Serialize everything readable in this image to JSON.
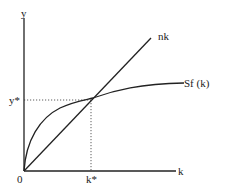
{
  "diagram": {
    "axes": {
      "y_label": "y",
      "x_label": "k",
      "origin_label": "0"
    },
    "curves": [
      {
        "name": "nk",
        "label": "nk",
        "type": "line"
      },
      {
        "name": "Sf(k)",
        "label": "Sf (k)",
        "type": "concave"
      }
    ],
    "equilibrium": {
      "y_label": "y*",
      "k_label": "k*"
    },
    "colors": {
      "line": "#222222",
      "background": "#ffffff"
    }
  }
}
